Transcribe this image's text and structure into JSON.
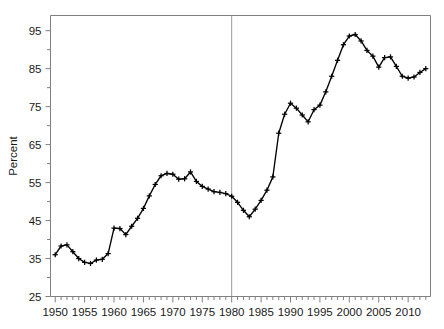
{
  "chart_data": {
    "type": "line",
    "title": "",
    "subtitle": "",
    "xlabel": "",
    "ylabel": "Percent",
    "xlim": [
      1949.2,
      2013.8
    ],
    "ylim": [
      25,
      99
    ],
    "grid": false,
    "legend": null,
    "y_ticks_major": [
      25,
      35,
      45,
      55,
      65,
      75,
      85,
      95
    ],
    "y_ticks_minor": [
      30,
      40,
      50,
      60,
      70,
      80,
      90
    ],
    "y_tick_labels": [
      "25",
      "35",
      "45",
      "55",
      "65",
      "75",
      "85",
      "95"
    ],
    "x_ticks_major": [
      1950,
      1955,
      1960,
      1965,
      1970,
      1975,
      1980,
      1985,
      1990,
      1995,
      2000,
      2005,
      2010
    ],
    "x_tick_labels": [
      "1950",
      "1955",
      "1960",
      "1965",
      "1970",
      "1975",
      "1980",
      "1985",
      "1990",
      "1995",
      "2000",
      "2005",
      "2010"
    ],
    "annotations": [
      {
        "name": "vertical-reference-line-1980",
        "type": "vline",
        "x": 1980,
        "color": "#9a9a9a"
      }
    ],
    "marker": "plus",
    "line_color": "#000000",
    "x": [
      1950,
      1951,
      1952,
      1953,
      1954,
      1955,
      1956,
      1957,
      1958,
      1959,
      1960,
      1961,
      1962,
      1963,
      1964,
      1965,
      1966,
      1967,
      1968,
      1969,
      1970,
      1971,
      1972,
      1973,
      1974,
      1975,
      1976,
      1977,
      1978,
      1979,
      1980,
      1981,
      1982,
      1983,
      1984,
      1985,
      1986,
      1987,
      1988,
      1989,
      1990,
      1991,
      1992,
      1993,
      1994,
      1995,
      1996,
      1997,
      1998,
      1999,
      2000,
      2001,
      2002,
      2003,
      2004,
      2005,
      2006,
      2007,
      2008,
      2009,
      2010,
      2011,
      2012,
      2013
    ],
    "values": [
      36.0,
      38.3,
      38.6,
      36.8,
      35.0,
      34.0,
      33.7,
      34.6,
      34.8,
      36.3,
      43.0,
      42.9,
      41.3,
      43.5,
      45.6,
      48.2,
      51.5,
      54.5,
      56.8,
      57.4,
      57.2,
      55.9,
      56.0,
      57.8,
      55.3,
      54.0,
      53.3,
      52.6,
      52.4,
      52.1,
      51.4,
      49.8,
      47.7,
      46.0,
      48.0,
      50.3,
      53.0,
      56.5,
      68.0,
      73.0,
      75.9,
      74.6,
      72.8,
      71.0,
      74.2,
      75.4,
      78.9,
      83.0,
      87.2,
      91.3,
      93.6,
      94.0,
      92.3,
      89.8,
      88.3,
      85.4,
      87.9,
      88.1,
      85.6,
      83.0,
      82.5,
      82.8,
      84.0,
      85.0
    ],
    "series_name": "percent"
  }
}
